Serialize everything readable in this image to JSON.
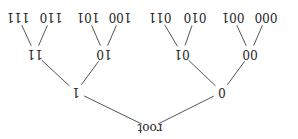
{
  "diagram": {
    "type": "binary-tree",
    "orientation": "rotated-180",
    "line_color": "#555555",
    "nodes": [
      {
        "id": "root",
        "label": "root",
        "x": 148,
        "y": 11
      },
      {
        "id": "0",
        "label": "0",
        "x": 76,
        "y": 47
      },
      {
        "id": "1",
        "label": "1",
        "x": 222,
        "y": 47
      },
      {
        "id": "00",
        "label": "00",
        "x": 48,
        "y": 85
      },
      {
        "id": "01",
        "label": "01",
        "x": 116,
        "y": 85
      },
      {
        "id": "10",
        "label": "10",
        "x": 194,
        "y": 85
      },
      {
        "id": "11",
        "label": "11",
        "x": 263,
        "y": 85
      },
      {
        "id": "000",
        "label": "000",
        "x": 32,
        "y": 122
      },
      {
        "id": "001",
        "label": "001",
        "x": 65,
        "y": 122
      },
      {
        "id": "010",
        "label": "010",
        "x": 103,
        "y": 122
      },
      {
        "id": "011",
        "label": "011",
        "x": 138,
        "y": 122
      },
      {
        "id": "100",
        "label": "100",
        "x": 178,
        "y": 122
      },
      {
        "id": "101",
        "label": "101",
        "x": 210,
        "y": 122
      },
      {
        "id": "110",
        "label": "110",
        "x": 247,
        "y": 122
      },
      {
        "id": "111",
        "label": "111",
        "x": 280,
        "y": 122
      }
    ],
    "edges": [
      [
        "root",
        "0"
      ],
      [
        "root",
        "1"
      ],
      [
        "0",
        "00"
      ],
      [
        "0",
        "01"
      ],
      [
        "1",
        "10"
      ],
      [
        "1",
        "11"
      ],
      [
        "00",
        "000"
      ],
      [
        "00",
        "001"
      ],
      [
        "01",
        "010"
      ],
      [
        "01",
        "011"
      ],
      [
        "10",
        "100"
      ],
      [
        "10",
        "101"
      ],
      [
        "11",
        "110"
      ],
      [
        "11",
        "111"
      ]
    ]
  }
}
